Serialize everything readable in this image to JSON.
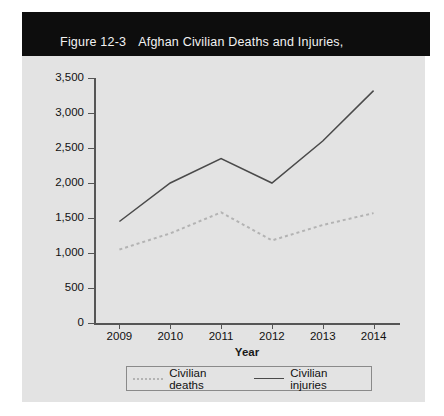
{
  "figure": {
    "number": "Figure 12-3",
    "title_line1": "Afghan Civilian Deaths and Injuries,",
    "title_line2": "2009–2014",
    "banner_color": "#0d0d0d",
    "panel_color": "#e3e3e3"
  },
  "chart_data": {
    "type": "line",
    "xlabel": "Year",
    "ylabel": "Afghan civilian deaths and injuries",
    "categories": [
      "2009",
      "2010",
      "2011",
      "2012",
      "2013",
      "2014"
    ],
    "x": [
      2009,
      2010,
      2011,
      2012,
      2013,
      2014
    ],
    "ylim": [
      0,
      3500
    ],
    "yticks": [
      0,
      500,
      1000,
      1500,
      2000,
      2500,
      3000,
      3500
    ],
    "ytick_labels": [
      "0",
      "500",
      "1,000",
      "1,500",
      "2,000",
      "2,500",
      "3,000",
      "3,500"
    ],
    "grid": false,
    "legend_position": "bottom",
    "series": [
      {
        "name": "Civilian deaths",
        "style": "dotted",
        "color": "#b3b3b3",
        "values": [
          1050,
          1280,
          1580,
          1180,
          1400,
          1570
        ]
      },
      {
        "name": "Civilian injuries",
        "style": "solid",
        "color": "#4a4a4a",
        "values": [
          1450,
          2000,
          2350,
          2000,
          2600,
          3320
        ]
      }
    ]
  },
  "legend": {
    "entries": [
      {
        "label": "Civilian deaths"
      },
      {
        "label": "Civilian injuries"
      }
    ]
  }
}
